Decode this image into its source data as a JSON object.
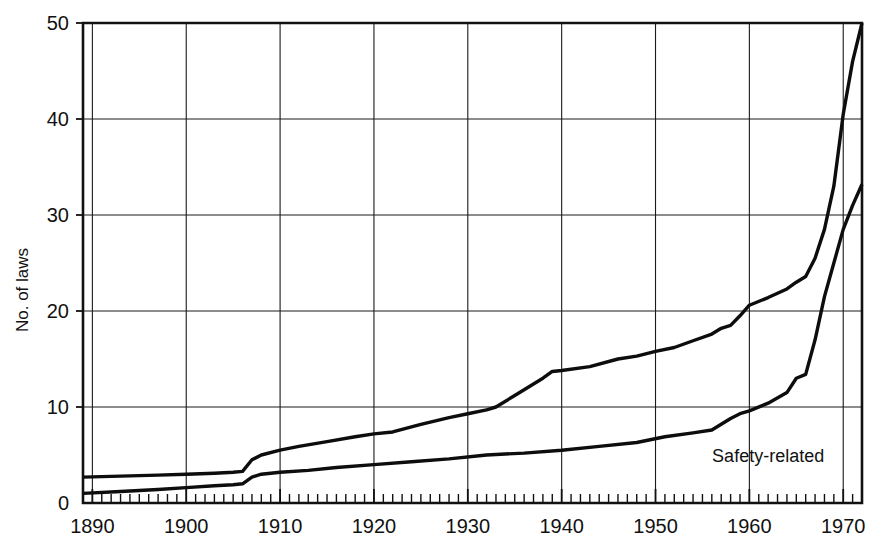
{
  "chart_data": {
    "type": "line",
    "title": "",
    "subtitle": "",
    "xlabel": "",
    "ylabel": "No. of laws",
    "xlim": [
      1889,
      1972
    ],
    "ylim": [
      0,
      50
    ],
    "grid": true,
    "legend_position": "inline-annotation",
    "x_tick_labels": [
      "1890",
      "1900",
      "1910",
      "1920",
      "1930",
      "1940",
      "1950",
      "1960",
      "1970"
    ],
    "x_tick_values": [
      1890,
      1900,
      1910,
      1920,
      1930,
      1940,
      1950,
      1960,
      1970
    ],
    "x_minor_tick_step": 1,
    "y_tick_labels": [
      "0",
      "10",
      "20",
      "30",
      "40",
      "50"
    ],
    "y_tick_values": [
      0,
      10,
      20,
      30,
      40,
      50
    ],
    "annotations": [
      {
        "text": "Safety-related",
        "x": 1962.0,
        "y": 4.3
      }
    ],
    "series": [
      {
        "name": "Total laws",
        "color": "#0d0d0d",
        "x": [
          1889,
          1893,
          1897,
          1900,
          1903,
          1905,
          1906,
          1907,
          1908,
          1910,
          1912,
          1915,
          1918,
          1920,
          1922,
          1925,
          1928,
          1930,
          1932,
          1933,
          1935,
          1937,
          1938,
          1939,
          1940,
          1943,
          1946,
          1948,
          1950,
          1952,
          1954,
          1956,
          1957,
          1958,
          1959,
          1960,
          1962,
          1964,
          1965,
          1966,
          1967,
          1968,
          1969,
          1970,
          1971,
          1972
        ],
        "values": [
          2.7,
          2.8,
          2.9,
          3.0,
          3.1,
          3.2,
          3.3,
          4.5,
          5.0,
          5.5,
          5.9,
          6.4,
          6.9,
          7.2,
          7.4,
          8.2,
          8.9,
          9.3,
          9.7,
          10.0,
          11.2,
          12.4,
          13.0,
          13.7,
          13.8,
          14.2,
          15.0,
          15.3,
          15.8,
          16.2,
          16.9,
          17.6,
          18.2,
          18.5,
          19.5,
          20.6,
          21.4,
          22.3,
          23.0,
          23.6,
          25.5,
          28.5,
          33.0,
          40.5,
          46.0,
          50.0
        ]
      },
      {
        "name": "Safety-related",
        "color": "#0d0d0d",
        "x": [
          1889,
          1893,
          1897,
          1900,
          1903,
          1905,
          1906,
          1907,
          1908,
          1910,
          1913,
          1916,
          1920,
          1924,
          1928,
          1932,
          1936,
          1940,
          1944,
          1948,
          1951,
          1954,
          1956,
          1958,
          1959,
          1960,
          1962,
          1964,
          1965,
          1966,
          1967,
          1968,
          1969,
          1970,
          1971,
          1972
        ],
        "values": [
          1.0,
          1.2,
          1.4,
          1.6,
          1.8,
          1.9,
          2.0,
          2.7,
          3.0,
          3.2,
          3.4,
          3.7,
          4.0,
          4.3,
          4.6,
          5.0,
          5.2,
          5.5,
          5.9,
          6.3,
          6.9,
          7.3,
          7.6,
          8.8,
          9.3,
          9.6,
          10.4,
          11.5,
          13.0,
          13.4,
          17.0,
          21.5,
          25.0,
          28.5,
          31.0,
          33.2
        ]
      }
    ]
  },
  "figure": {
    "y_axis_title": "No. of laws",
    "background_color": "#ffffff",
    "line_color": "#0d0d0d",
    "grid_color": "#1a1a1a"
  }
}
